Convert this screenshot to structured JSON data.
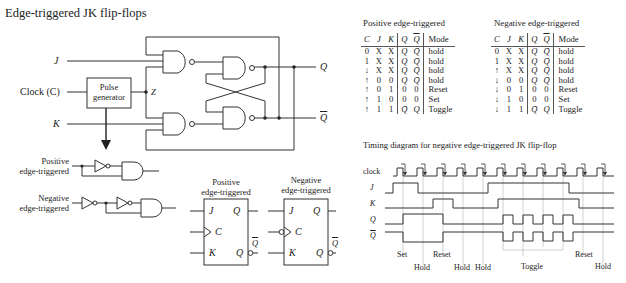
{
  "title": "Edge-triggered JK flip-flops",
  "circuit": {
    "inputs": {
      "j": "J",
      "clock": "Clock (C)",
      "k": "K"
    },
    "pulse_generator": {
      "line1": "Pulse",
      "line2": "generator"
    },
    "node_z": "Z",
    "outputs": {
      "q": "Q",
      "q_bar": "Q"
    }
  },
  "edge_detectors": {
    "positive": {
      "line1": "Positive",
      "line2": "edge-triggered"
    },
    "negative": {
      "line1": "Negative",
      "line2": "edge-triggered"
    }
  },
  "symbols": {
    "positive": {
      "title1": "Positive",
      "title2": "edge-triggered",
      "j": "J",
      "c": "C",
      "k": "K",
      "q": "Q",
      "q_bar_inner": "Q",
      "q_bar_outer": "Q"
    },
    "negative": {
      "title1": "Negative",
      "title2": "edge-triggered",
      "j": "J",
      "c": "C",
      "k": "K",
      "q": "Q",
      "q_bar_inner": "Q",
      "q_bar_outer": "Q"
    }
  },
  "tables": {
    "positive": {
      "title": "Positive edge-triggered",
      "headers": [
        "C",
        "J",
        "K",
        "Q",
        "Q",
        "Mode"
      ],
      "rows": [
        [
          "0",
          "X",
          "X",
          "Q",
          "Q̄",
          "hold"
        ],
        [
          "1",
          "X",
          "X",
          "Q",
          "Q̄",
          "hold"
        ],
        [
          "↓",
          "X",
          "X",
          "Q",
          "Q̄",
          "hold"
        ],
        [
          "↑",
          "0",
          "0",
          "Q",
          "Q̄",
          "hold"
        ],
        [
          "↑",
          "0",
          "1",
          "0",
          "0",
          "Reset"
        ],
        [
          "↑",
          "1",
          "0",
          "0",
          "0",
          "Set"
        ],
        [
          "↑",
          "1",
          "1",
          "Q̄",
          "Q",
          "Toggle"
        ]
      ]
    },
    "negative": {
      "title": "Negative edge-triggered",
      "headers": [
        "C",
        "J",
        "K",
        "Q",
        "Q",
        "Mode"
      ],
      "rows": [
        [
          "0",
          "X",
          "X",
          "Q",
          "Q̄",
          "hold"
        ],
        [
          "1",
          "X",
          "X",
          "Q",
          "Q̄",
          "hold"
        ],
        [
          "↑",
          "X",
          "X",
          "Q",
          "Q̄",
          "hold"
        ],
        [
          "↓",
          "0",
          "0",
          "Q",
          "Q̄",
          "hold"
        ],
        [
          "↓",
          "0",
          "1",
          "0",
          "0",
          "Reset"
        ],
        [
          "↓",
          "1",
          "0",
          "0",
          "0",
          "Set"
        ],
        [
          "↓",
          "1",
          "1",
          "Q̄",
          "Q",
          "Toggle"
        ]
      ]
    }
  },
  "timing": {
    "title": "Timing diagram for negative edge-triggered JK flip-flop",
    "signals": [
      "clock",
      "J",
      "K",
      "Q",
      "Q"
    ],
    "annotations": {
      "set": "Set",
      "hold1": "Hold",
      "reset1": "Reset",
      "hold2": "Hold",
      "hold3": "Hold",
      "toggle": "Toggle",
      "reset2": "Reset",
      "hold4": "Hold"
    }
  }
}
